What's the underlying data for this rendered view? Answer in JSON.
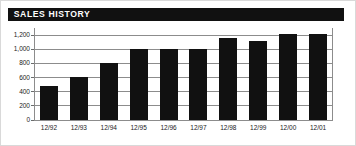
{
  "header": {
    "title": "SALES HISTORY",
    "bar_color": "#111111",
    "text_color": "#ffffff"
  },
  "frame": {
    "border_color": "#d9d9d9",
    "background": "#ffffff"
  },
  "chart_data": {
    "type": "bar",
    "title": "SALES HISTORY",
    "xlabel": "",
    "ylabel": "",
    "categories": [
      "12/92",
      "12/93",
      "12/94",
      "12/95",
      "12/96",
      "12/97",
      "12/98",
      "12/99",
      "12/00",
      "12/01"
    ],
    "values": [
      480,
      610,
      810,
      1010,
      1010,
      1010,
      1160,
      1110,
      1210,
      1210
    ],
    "ylim": [
      0,
      1300
    ],
    "yticks": [
      0,
      200,
      400,
      600,
      800,
      1000,
      1200
    ],
    "ytick_labels": [
      "0",
      "200",
      "400",
      "600",
      "800",
      "1,000",
      "1,200"
    ],
    "grid": true,
    "grid_color": "#8c8c8c",
    "bar_color": "#111111",
    "legend": null,
    "legend_position": "none"
  }
}
